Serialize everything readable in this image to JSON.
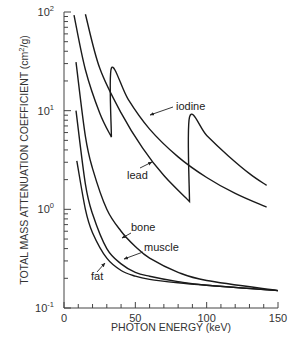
{
  "chart_data": {
    "type": "line",
    "title": "",
    "xlabel": "PHOTON ENERGY (keV)",
    "ylabel": "TOTAL MASS ATTENUATION COEFFICIENT (cm²/g)",
    "xlim": [
      0,
      150
    ],
    "ylim": [
      0.1,
      100
    ],
    "yscale": "log",
    "grid": false,
    "legend": "inline labels with arrows",
    "x_ticks": [
      "0",
      "50",
      "100",
      "150"
    ],
    "y_ticks": [
      {
        "base": "10",
        "exp": "-1"
      },
      {
        "base": "10",
        "exp": "0"
      },
      {
        "base": "10",
        "exp": "1"
      },
      {
        "base": "10",
        "exp": "2"
      }
    ],
    "series": [
      {
        "name": "iodine",
        "points": [
          [
            7,
            93
          ],
          [
            15,
            26
          ],
          [
            25,
            9.5
          ],
          [
            33.2,
            5.4
          ],
          [
            33.2,
            27
          ],
          [
            45,
            13
          ],
          [
            60,
            6.5
          ],
          [
            80,
            3.4
          ],
          [
            100,
            2.1
          ],
          [
            120,
            1.45
          ],
          [
            142,
            1.05
          ]
        ]
      },
      {
        "name": "lead",
        "points": [
          [
            15,
            95
          ],
          [
            25,
            27
          ],
          [
            40,
            9.5
          ],
          [
            55,
            4.2
          ],
          [
            70,
            2.2
          ],
          [
            88,
            1.2
          ],
          [
            88,
            8.6
          ],
          [
            100,
            5.6
          ],
          [
            115,
            3.5
          ],
          [
            130,
            2.3
          ],
          [
            142,
            1.75
          ]
        ]
      },
      {
        "name": "bone",
        "points": [
          [
            8.4,
            31
          ],
          [
            15,
            5.5
          ],
          [
            20,
            2.6
          ],
          [
            30,
            1.0
          ],
          [
            40,
            0.6
          ],
          [
            50,
            0.42
          ],
          [
            60,
            0.32
          ],
          [
            80,
            0.23
          ],
          [
            100,
            0.19
          ],
          [
            150,
            0.15
          ]
        ]
      },
      {
        "name": "muscle",
        "points": [
          [
            8.4,
            10
          ],
          [
            15,
            1.8
          ],
          [
            20,
            0.9
          ],
          [
            30,
            0.4
          ],
          [
            40,
            0.28
          ],
          [
            50,
            0.23
          ],
          [
            60,
            0.21
          ],
          [
            80,
            0.185
          ],
          [
            100,
            0.17
          ],
          [
            150,
            0.15
          ]
        ]
      },
      {
        "name": "fat",
        "points": [
          [
            9,
            3.1
          ],
          [
            15,
            1.0
          ],
          [
            20,
            0.58
          ],
          [
            30,
            0.32
          ],
          [
            40,
            0.24
          ],
          [
            50,
            0.21
          ],
          [
            60,
            0.195
          ],
          [
            80,
            0.18
          ],
          [
            100,
            0.17
          ],
          [
            150,
            0.15
          ]
        ]
      }
    ],
    "annotations": [
      "iodine",
      "lead",
      "bone",
      "muscle",
      "fat"
    ]
  },
  "axes": {
    "x_title": "PHOTON ENERGY (keV)",
    "y_title_main": "TOTAL MASS ATTENUATION COEFFICIENT (cm",
    "y_title_sup": "2",
    "y_title_end": "/g)"
  }
}
